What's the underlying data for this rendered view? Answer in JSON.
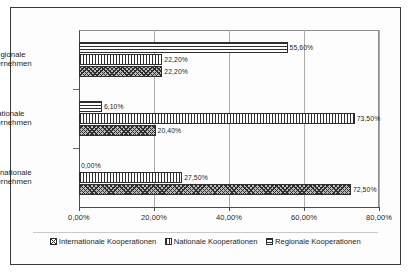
{
  "chart_data": {
    "type": "bar",
    "orientation": "horizontal",
    "title": "",
    "xlabel": "",
    "ylabel": "",
    "xlim": [
      0,
      80
    ],
    "grid": true,
    "legend_position": "bottom",
    "categories": [
      "Regionale Unternehmen",
      "Nationale Unternehmen",
      "Internationale Unternehmen"
    ],
    "category_lines": [
      [
        "Regionale",
        "Unternehmen"
      ],
      [
        "Nationale",
        "Unternehmen"
      ],
      [
        "Internationale",
        "Unternehmen"
      ]
    ],
    "xticks": [
      0,
      20,
      40,
      60,
      80
    ],
    "xtick_labels": [
      "0,00%",
      "20,00%",
      "40,00%",
      "60,00%",
      "80,00%"
    ],
    "series": [
      {
        "name": "Regionale Kooperationen",
        "pattern": "horizontal-lines",
        "values": [
          55.6,
          6.1,
          0.0
        ],
        "labels": [
          "55,60%",
          "6,10%",
          "0,00%"
        ]
      },
      {
        "name": "Nationale Kooperationen",
        "pattern": "vertical-lines",
        "values": [
          22.2,
          73.5,
          27.5
        ],
        "labels": [
          "22,20%",
          "73,50%",
          "27,50%"
        ]
      },
      {
        "name": "Internationale Kooperationen",
        "pattern": "diagonal-crosshatch",
        "values": [
          22.2,
          20.4,
          72.5
        ],
        "labels": [
          "22,20%",
          "20,40%",
          "72,50%"
        ]
      }
    ]
  },
  "legend": {
    "items": [
      {
        "label": "Internationale Kooperationen",
        "pattern": "diagonal-crosshatch"
      },
      {
        "label": "Nationale Kooperationen",
        "pattern": "vertical-lines"
      },
      {
        "label": "Regionale Kooperationen",
        "pattern": "horizontal-lines"
      }
    ]
  },
  "colors": {
    "ink": "#2e2e2e",
    "grid": "#adadad",
    "background": "#ffffff",
    "fill": "#b9b9b9"
  }
}
